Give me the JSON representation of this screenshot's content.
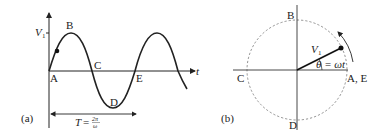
{
  "panel_a": {
    "label": "(a)",
    "axis_t": "t",
    "amplitude_label": "V",
    "amplitude_sub": "1",
    "points": [
      "A",
      "B",
      "C",
      "D",
      "E"
    ],
    "period_label_T": "T",
    "period_label_eq": "=",
    "period_num": "2π",
    "period_den": "ω"
  },
  "panel_b": {
    "label": "(b)",
    "top": "B",
    "left": "C",
    "bottom": "D",
    "right": "A, E",
    "phasor_label": "V",
    "phasor_sub": "1",
    "angle_label": "θ = ωt"
  },
  "colors": {
    "stroke": "#222222",
    "dashed": "#666666"
  }
}
